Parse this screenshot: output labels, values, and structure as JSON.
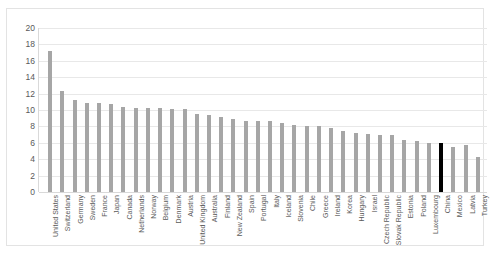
{
  "chart_data": {
    "type": "bar",
    "title": "",
    "xlabel": "",
    "ylabel": "",
    "ylim": [
      0,
      20
    ],
    "ytick_step": 2,
    "yticks": [
      20,
      18,
      16,
      14,
      12,
      10,
      8,
      6,
      4,
      2,
      0
    ],
    "grid": true,
    "legend": "none",
    "bar_color": "#a6a6a6",
    "highlight_color": "#000000",
    "highlight_category": "China",
    "categories": [
      "United States",
      "Switzerland",
      "Germany",
      "Sweden",
      "France",
      "Japan",
      "Canada",
      "Netherlands",
      "Norway",
      "Belgium",
      "Denmark",
      "Austria",
      "United Kingdom",
      "Australia",
      "Finland",
      "New Zealand",
      "Spain",
      "Portugal",
      "Italy",
      "Iceland",
      "Slovenia",
      "Chile",
      "Greece",
      "Ireland",
      "Korea",
      "Hungary",
      "Israel",
      "Czech Republic",
      "Slovak Republic",
      "Estonia",
      "Poland",
      "Luxembourg",
      "China",
      "Mexico",
      "Latvia",
      "Turkey"
    ],
    "values": [
      17.2,
      12.3,
      11.2,
      10.9,
      10.9,
      10.7,
      10.4,
      10.3,
      10.3,
      10.2,
      10.1,
      10.1,
      9.5,
      9.4,
      9.1,
      8.9,
      8.7,
      8.6,
      8.6,
      8.4,
      8.2,
      8.1,
      8.0,
      7.8,
      7.4,
      7.2,
      7.1,
      7.0,
      6.9,
      6.4,
      6.2,
      6.0,
      6.0,
      5.5,
      5.7,
      4.3
    ]
  }
}
